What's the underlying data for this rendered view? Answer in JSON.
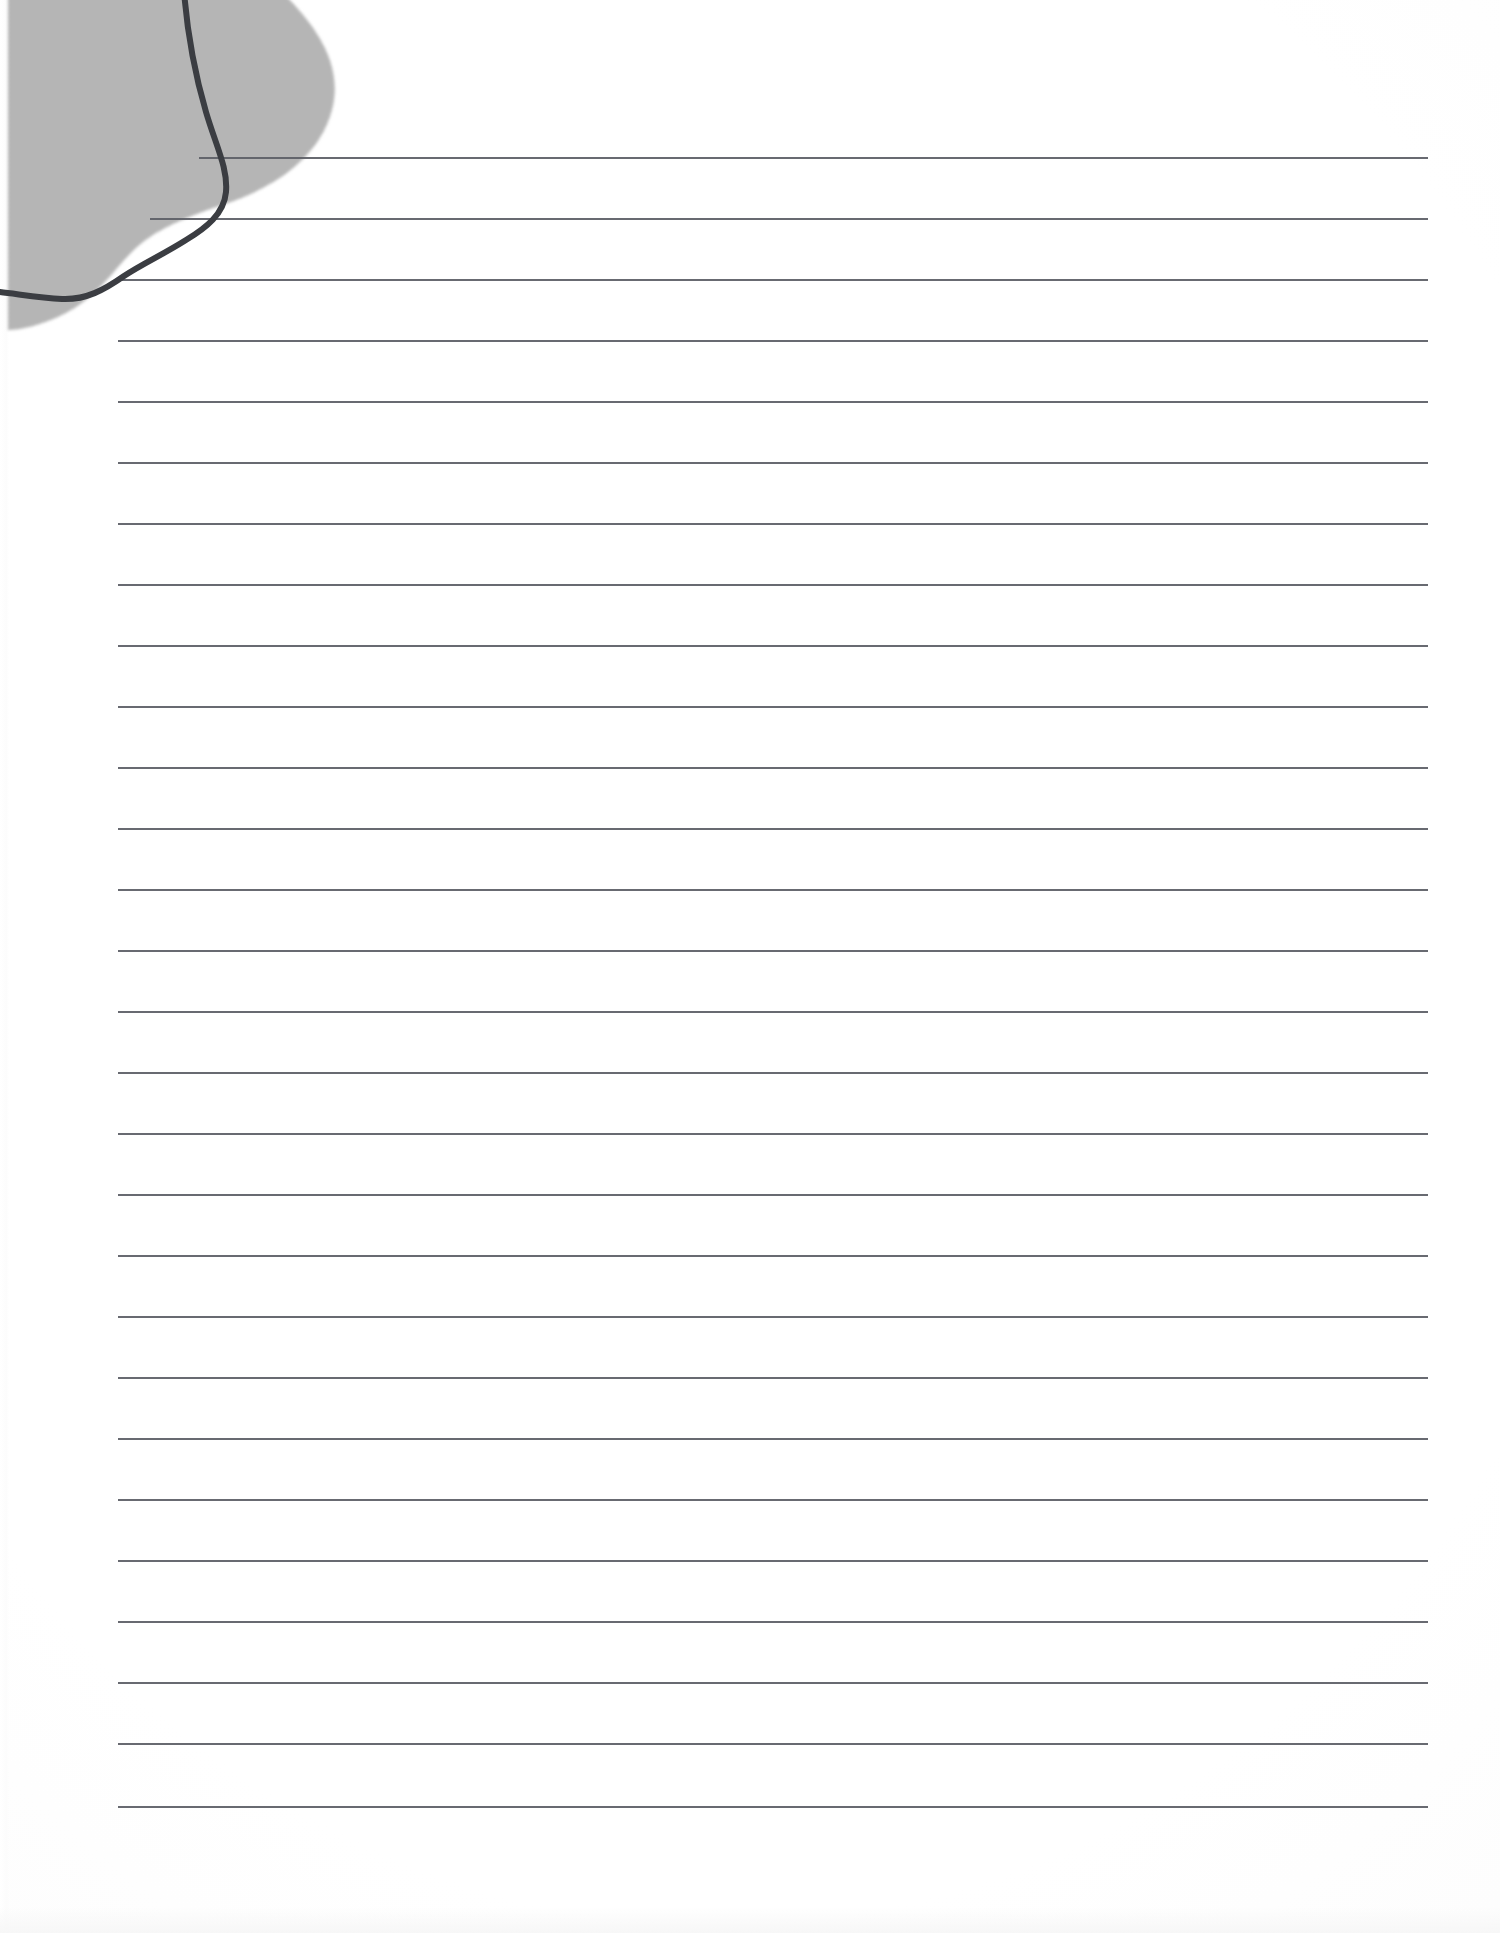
{
  "document": {
    "kind": "scanned-ruled-notebook-page",
    "page_width_px": 1500,
    "page_height_px": 1933,
    "background_color": "#ffffff",
    "caption": ""
  },
  "paper": {
    "sheet_color": "#ffffff",
    "scan_tint_color": "#f6f6f6",
    "left_scan_margin_px": 9,
    "bottom_scan_margin_px": 26
  },
  "ruling": {
    "line_color": "#5c5f66",
    "line_thickness_px": 2,
    "line_count": 28,
    "first_line_y_px": 157,
    "line_spacing_px": 61,
    "default_left_x_px": 118,
    "right_x_px": 1428,
    "lines": [
      {
        "index": 1,
        "y": 157,
        "x_start": 199,
        "x_end": 1428
      },
      {
        "index": 2,
        "y": 218,
        "x_start": 150,
        "x_end": 1428
      },
      {
        "index": 3,
        "y": 279,
        "x_start": 118,
        "x_end": 1428
      },
      {
        "index": 4,
        "y": 340,
        "x_start": 118,
        "x_end": 1428
      },
      {
        "index": 5,
        "y": 401,
        "x_start": 118,
        "x_end": 1428
      },
      {
        "index": 6,
        "y": 462,
        "x_start": 118,
        "x_end": 1428
      },
      {
        "index": 7,
        "y": 523,
        "x_start": 118,
        "x_end": 1428
      },
      {
        "index": 8,
        "y": 584,
        "x_start": 118,
        "x_end": 1428
      },
      {
        "index": 9,
        "y": 645,
        "x_start": 118,
        "x_end": 1428
      },
      {
        "index": 10,
        "y": 706,
        "x_start": 118,
        "x_end": 1428
      },
      {
        "index": 11,
        "y": 767,
        "x_start": 118,
        "x_end": 1428
      },
      {
        "index": 12,
        "y": 828,
        "x_start": 118,
        "x_end": 1428
      },
      {
        "index": 13,
        "y": 889,
        "x_start": 118,
        "x_end": 1428
      },
      {
        "index": 14,
        "y": 950,
        "x_start": 118,
        "x_end": 1428
      },
      {
        "index": 15,
        "y": 1011,
        "x_start": 118,
        "x_end": 1428
      },
      {
        "index": 16,
        "y": 1072,
        "x_start": 118,
        "x_end": 1428
      },
      {
        "index": 17,
        "y": 1133,
        "x_start": 118,
        "x_end": 1428
      },
      {
        "index": 18,
        "y": 1194,
        "x_start": 118,
        "x_end": 1428
      },
      {
        "index": 19,
        "y": 1255,
        "x_start": 118,
        "x_end": 1428
      },
      {
        "index": 20,
        "y": 1316,
        "x_start": 118,
        "x_end": 1428
      },
      {
        "index": 21,
        "y": 1377,
        "x_start": 118,
        "x_end": 1428
      },
      {
        "index": 22,
        "y": 1438,
        "x_start": 118,
        "x_end": 1428
      },
      {
        "index": 23,
        "y": 1499,
        "x_start": 118,
        "x_end": 1428
      },
      {
        "index": 24,
        "y": 1560,
        "x_start": 118,
        "x_end": 1428
      },
      {
        "index": 25,
        "y": 1621,
        "x_start": 118,
        "x_end": 1428
      },
      {
        "index": 26,
        "y": 1682,
        "x_start": 118,
        "x_end": 1428
      },
      {
        "index": 27,
        "y": 1743,
        "x_start": 118,
        "x_end": 1428
      },
      {
        "index": 28,
        "y": 1806,
        "x_start": 118,
        "x_end": 1428
      }
    ]
  },
  "artwork": {
    "blob": {
      "name": "grey-halftone-blob",
      "fill_color": "#b6b6b6",
      "texture": "halftone-dither",
      "corner": "top-left",
      "approx_extent": {
        "x_max": 345,
        "y_max": 330
      },
      "path": "M 8,-10 L 280,-10 C 310,20 345,60 332,110 C 318,162 268,190 222,205 C 178,220 150,232 128,256 C 108,278 92,300 64,314 C 40,326 20,330 8,330 Z"
    },
    "ink_curve": {
      "name": "hand-drawn-ink-curve",
      "stroke_color": "#3a3d42",
      "stroke_width_px": 6,
      "path": "M 184,-8 C 188,40 196,78 206,112 C 216,146 228,168 226,192 C 224,214 206,228 186,240 C 164,254 142,264 124,276 C 104,290 86,300 62,299 C 40,298 18,294 0,292"
    }
  },
  "interaction": {
    "notes": "Static scanned image of blank ruled paper; no interactive controls present."
  }
}
